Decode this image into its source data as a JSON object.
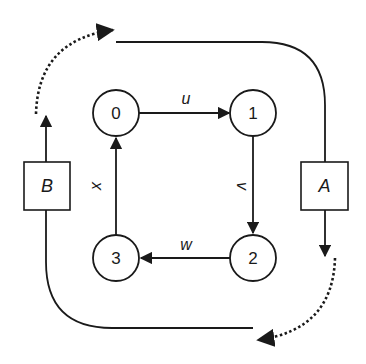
{
  "diagram": {
    "type": "state-cycle-diagram",
    "colors": {
      "stroke": "#1a1a1a",
      "background": "#ffffff"
    },
    "nodes": [
      {
        "id": "0",
        "label": "0"
      },
      {
        "id": "1",
        "label": "1"
      },
      {
        "id": "2",
        "label": "2"
      },
      {
        "id": "3",
        "label": "3"
      }
    ],
    "edges": [
      {
        "from": "0",
        "to": "1",
        "label": "u"
      },
      {
        "from": "1",
        "to": "2",
        "label": "v"
      },
      {
        "from": "2",
        "to": "3",
        "label": "w"
      },
      {
        "from": "3",
        "to": "0",
        "label": "x"
      }
    ],
    "boxes": [
      {
        "id": "A",
        "label": "A"
      },
      {
        "id": "B",
        "label": "B"
      }
    ],
    "loops": [
      {
        "path": "top",
        "style": "solid-line-into-A",
        "from": "top",
        "to": "A"
      },
      {
        "path": "bottom",
        "style": "solid-line-from-B",
        "from": "B",
        "to": "bottom"
      },
      {
        "path": "top-left-arc",
        "style": "dotted-arrow"
      },
      {
        "path": "bottom-right-arc",
        "style": "dotted-arrow"
      }
    ]
  }
}
